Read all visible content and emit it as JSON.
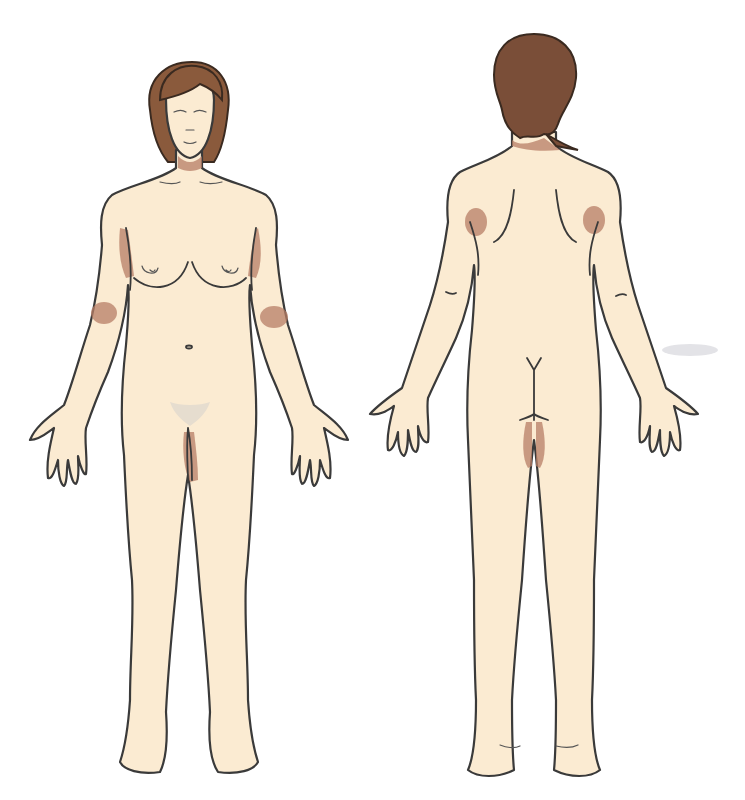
{
  "diagram": {
    "type": "anatomical-body-map",
    "views": [
      {
        "id": "front",
        "label": ""
      },
      {
        "id": "back",
        "label": ""
      }
    ],
    "colors": {
      "background": "#ffffff",
      "skin": "#fbebd2",
      "outline": "#3a3a3a",
      "highlight": "#b77d66",
      "hair_front": "#8a5a3c",
      "hair_back": "#7a4e38"
    },
    "highlighted_regions": [
      {
        "view": "front",
        "region": "left-axilla"
      },
      {
        "view": "front",
        "region": "right-axilla"
      },
      {
        "view": "front",
        "region": "left-antecubital-fossa"
      },
      {
        "view": "front",
        "region": "right-antecubital-fossa"
      },
      {
        "view": "front",
        "region": "groin-inner-thigh"
      },
      {
        "view": "back",
        "region": "left-posterior-axilla"
      },
      {
        "view": "back",
        "region": "right-posterior-axilla"
      },
      {
        "view": "back",
        "region": "gluteal-fold-inner-thigh"
      },
      {
        "view": "back",
        "region": "nape-of-neck"
      }
    ]
  }
}
